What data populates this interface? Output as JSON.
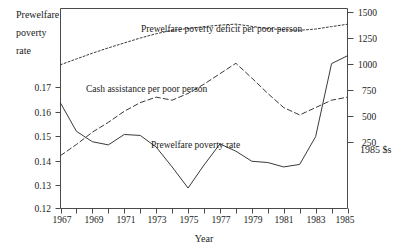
{
  "chart_data": {
    "type": "line",
    "title": "",
    "xlabel": "Year",
    "ylabel": "Prewelfare poverty rate",
    "y2label": "1985 $s",
    "x": [
      1967,
      1968,
      1969,
      1970,
      1971,
      1972,
      1973,
      1974,
      1975,
      1976,
      1977,
      1978,
      1979,
      1980,
      1981,
      1982,
      1983,
      1984,
      1985
    ],
    "xlim": [
      1967,
      1985
    ],
    "xtick_labels": [
      "1967",
      "1969",
      "1971",
      "1973",
      "1975",
      "1977",
      "1979",
      "1981",
      "1983",
      "1985"
    ],
    "xticks_major": [
      1967,
      1969,
      1971,
      1973,
      1975,
      1977,
      1979,
      1981,
      1983,
      1985
    ],
    "xticks_minor": [
      1968,
      1970,
      1972,
      1974,
      1976,
      1978,
      1980,
      1982,
      1984
    ],
    "ylim": [
      0.115,
      0.1785
    ],
    "ytick_labels": [
      "0.17",
      "0.16",
      "0.15",
      "0.14",
      "0.13",
      "0.12"
    ],
    "yticks": [
      0.17,
      0.16,
      0.15,
      0.14,
      0.13,
      0.12
    ],
    "y2lim": [
      0,
      1625
    ],
    "y2tick_labels": [
      "1500",
      "1250",
      "1000",
      "750",
      "500",
      "250"
    ],
    "y2ticks": [
      1500,
      1250,
      1000,
      750,
      500,
      250
    ],
    "grid": false,
    "legend_position": "inline-annotations",
    "series": [
      {
        "name": "Prewelfare poverty rate",
        "axis": "left",
        "style": "solid",
        "label_text": "Prewelfare poverty rate",
        "values": [
          0.1485,
          0.1395,
          0.1362,
          0.1352,
          0.1385,
          0.1382,
          0.1345,
          0.1282,
          0.1215,
          0.1288,
          0.1355,
          0.1332,
          0.13,
          0.1296,
          0.1282,
          0.129,
          0.1378,
          0.161,
          0.1635
        ]
      },
      {
        "name": "Cash assistance per poor person",
        "axis": "right",
        "style": "dashed",
        "label_text": "Cash assistance per poor person",
        "values": [
          430,
          520,
          620,
          700,
          790,
          860,
          905,
          880,
          935,
          1010,
          1095,
          1180,
          1060,
          935,
          820,
          760,
          820,
          880,
          905
        ]
      },
      {
        "name": "Prewelfare poverty deficit per poor person",
        "axis": "right",
        "style": "dotted",
        "label_text": "Prewelfare poverty deficit per poor person",
        "values": [
          1168,
          1215,
          1262,
          1305,
          1345,
          1385,
          1420,
          1448,
          1462,
          1478,
          1490,
          1498,
          1480,
          1462,
          1452,
          1448,
          1458,
          1478,
          1497
        ]
      }
    ]
  },
  "labels": {
    "y_axis_line1": "Prewelfare",
    "y_axis_line2": "poverty",
    "y_axis_line3": "rate",
    "x_axis_title": "Year",
    "y2_axis_title": "1985 $s",
    "series_deficit": "Prewelfare poverty deficit per poor person",
    "series_cash": "Cash assistance per poor person",
    "series_rate": "Prewelfare poverty rate"
  }
}
